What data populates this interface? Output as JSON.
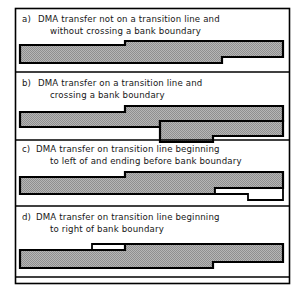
{
  "figure": {
    "background_color": "#ffffff",
    "line_color": "#000000",
    "fill_color": "#a8a8a8",
    "frame": {
      "x": 15,
      "y": 8,
      "width": 275,
      "height": 276
    }
  },
  "panels": [
    {
      "id": "a",
      "label": "a)",
      "caption_line1": "DMA transfer not on a transition line and",
      "caption_line2": "without crossing a bank boundary",
      "caption_line1_pos": {
        "x": 38,
        "y": 22
      },
      "caption_line2_pos": {
        "x": 50,
        "y": 34
      },
      "separator_y": 72,
      "filled_band": {
        "name": "transfer-band-a",
        "points": "20,45 125,45 125,41 283,41 283,57 222,57 222,63 20,63"
      },
      "outline_band": null
    },
    {
      "id": "b",
      "label": "b)",
      "caption_line1": "DMA transfer on a transition line and",
      "caption_line2": "crossing a bank boundary",
      "caption_line1_pos": {
        "x": 38,
        "y": 86
      },
      "caption_line2_pos": {
        "x": 50,
        "y": 98
      },
      "separator_y": 140,
      "filled_band": {
        "name": "transfer-band-b",
        "points": "20,112 125,112 125,107 160,107 160,121 210,121 210,127 20,127"
      },
      "outline_band": {
        "name": "transfer-outline-b",
        "points": "160,121 283,121 283,107 160,107"
      },
      "extra_band": {
        "name": "transfer-band-b-right",
        "points": "160,121 283,121 283,107 160,107"
      }
    },
    {
      "id": "c",
      "label": "c)",
      "caption_line1": "DMA transfer on transition line beginning",
      "caption_line2": "to left of and ending before bank boundary",
      "caption_line1_pos": {
        "x": 36,
        "y": 152
      },
      "caption_line2_pos": {
        "x": 50,
        "y": 164
      },
      "separator_y": 206,
      "filled_band": {
        "name": "transfer-band-c",
        "points": "20,177 125,177 125,172 283,172 283,188 215,188 215,194 20,194"
      },
      "outline_band": {
        "name": "transfer-outline-c",
        "points": "215,188 215,200 250,200 250,194 283,194 283,188"
      }
    },
    {
      "id": "d",
      "label": "d)",
      "caption_line1": "DMA transfer on transition line beginning",
      "caption_line2": "to right of bank boundary",
      "caption_line1_pos": {
        "x": 36,
        "y": 220
      },
      "caption_line2_pos": {
        "x": 50,
        "y": 232
      },
      "separator_y": 284,
      "filled_band": {
        "name": "transfer-band-d",
        "points": "20,250 125,250 125,244 283,244 283,262 213,262 213,268 20,268"
      },
      "outline_band": {
        "name": "transfer-outline-d",
        "points": "20,250 92,250 92,244 125,244 125,250"
      }
    }
  ],
  "legend": {
    "filled_meaning": "DMA transfer extent",
    "outline_meaning": "bank boundary / transition line offset"
  }
}
